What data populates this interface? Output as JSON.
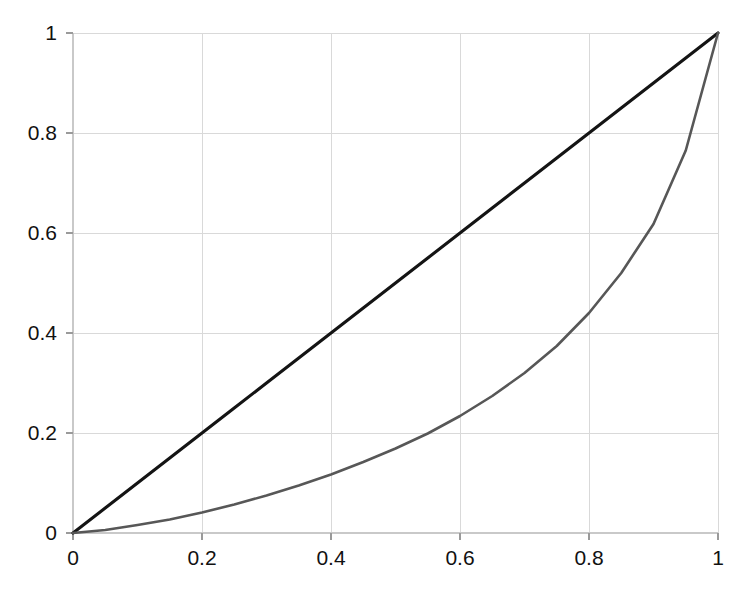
{
  "chart_data": {
    "type": "line",
    "title": "",
    "subtitle": "",
    "xlabel": "",
    "ylabel": "",
    "xlim": [
      0,
      1
    ],
    "ylim": [
      0,
      1
    ],
    "grid": true,
    "legend": "none",
    "background": "#ffffff",
    "x_ticks": [
      "0",
      "0.2",
      "0.4",
      "0.6",
      "0.8",
      "1"
    ],
    "x_tick_values": [
      0,
      0.2,
      0.4,
      0.6,
      0.8,
      1
    ],
    "y_ticks": [
      "0",
      "0.2",
      "0.4",
      "0.6",
      "0.8",
      "1"
    ],
    "y_tick_values": [
      0,
      0.2,
      0.4,
      0.6,
      0.8,
      1
    ],
    "x": [
      0,
      0.05,
      0.1,
      0.15,
      0.2,
      0.25,
      0.3,
      0.35,
      0.4,
      0.45,
      0.5,
      0.55,
      0.6,
      0.65,
      0.7,
      0.75,
      0.8,
      0.85,
      0.9,
      0.95,
      1
    ],
    "series": [
      {
        "name": "equality-line",
        "color": "#141414",
        "style": "solid",
        "width": 3.1,
        "values": [
          0,
          0.05,
          0.1,
          0.15,
          0.2,
          0.25,
          0.3,
          0.35,
          0.4,
          0.45,
          0.5,
          0.55,
          0.6,
          0.65,
          0.7,
          0.75,
          0.8,
          0.85,
          0.9,
          0.95,
          1
        ]
      },
      {
        "name": "lorenz-curve",
        "color": "#575757",
        "style": "solid",
        "width": 2.6,
        "values": [
          0,
          0.006,
          0.016,
          0.027,
          0.041,
          0.057,
          0.075,
          0.095,
          0.117,
          0.142,
          0.169,
          0.199,
          0.234,
          0.274,
          0.32,
          0.374,
          0.44,
          0.52,
          0.618,
          0.765,
          1
        ]
      }
    ],
    "annotations": []
  },
  "axes": {
    "x_axis_name": "x-axis",
    "y_axis_name": "y-axis"
  }
}
